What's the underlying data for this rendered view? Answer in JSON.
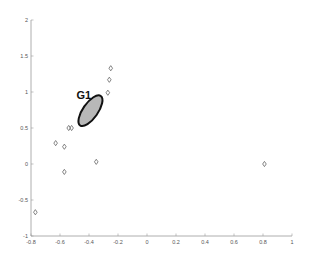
{
  "chart_data": {
    "type": "scatter",
    "title": "",
    "xlabel": "",
    "ylabel": "",
    "xlim": [
      -0.8,
      1
    ],
    "ylim": [
      -1,
      2
    ],
    "grid": false,
    "x_ticks": [
      -0.8,
      -0.6,
      -0.4,
      -0.2,
      0,
      0.2,
      0.4,
      0.6,
      0.8,
      1
    ],
    "x_tick_labels": [
      "-0.8",
      "-0.6",
      "-0.4",
      "-0.2",
      "0",
      "0.2",
      "0.4",
      "0.6",
      "0.8",
      "1"
    ],
    "y_ticks": [
      -1,
      -0.5,
      0,
      0.5,
      1,
      1.5,
      2
    ],
    "y_tick_labels": [
      "-1",
      "-0.5",
      "0",
      "0.5",
      "1",
      "1.5",
      "2"
    ],
    "marker": "diamond",
    "series": [
      {
        "name": "points",
        "points": [
          {
            "x": -0.25,
            "y": 1.33
          },
          {
            "x": -0.26,
            "y": 1.17
          },
          {
            "x": -0.27,
            "y": 0.99
          },
          {
            "x": -0.54,
            "y": 0.5
          },
          {
            "x": -0.52,
            "y": 0.5
          },
          {
            "x": -0.63,
            "y": 0.29
          },
          {
            "x": -0.57,
            "y": 0.24
          },
          {
            "x": -0.35,
            "y": 0.03
          },
          {
            "x": -0.57,
            "y": -0.11
          },
          {
            "x": 0.81,
            "y": 0.0
          },
          {
            "x": -0.77,
            "y": -0.67
          }
        ]
      }
    ],
    "annotations": [
      {
        "type": "ellipse",
        "label": "G1",
        "center": {
          "x": -0.39,
          "y": 0.74
        },
        "fill": "#b8b8b8",
        "stroke": "#111111"
      }
    ]
  }
}
